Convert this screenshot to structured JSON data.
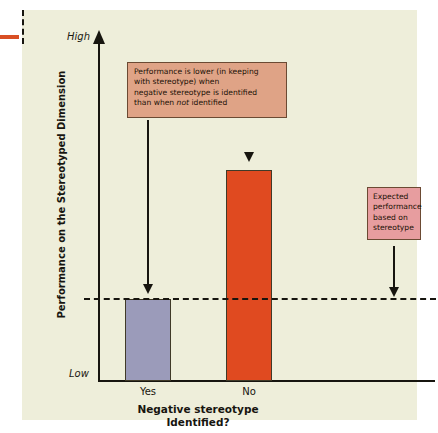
{
  "chart_data": {
    "type": "bar",
    "title": "",
    "categories": [
      "Yes",
      "No"
    ],
    "values": [
      1,
      2.57
    ],
    "series": [
      {
        "name": "Performance on the Stereotyped Dimension",
        "values": [
          1,
          2.57
        ],
        "colors": [
          "#9b9bba",
          "#e04a20"
        ]
      }
    ],
    "xlabel": "Negative stereotype Identified?",
    "ylabel": "Performance on the Stereotyped Dimension",
    "ytick_labels": [
      "Low",
      "High"
    ],
    "ylim": [
      "Low",
      "High"
    ],
    "grid": false,
    "legend": "none",
    "reference_line": {
      "label": "Expected performance based on stereotype",
      "value": 1,
      "style": "dashed"
    },
    "annotations": [
      "Performance is lower (in keeping with stereotype) when negative stereotype is identified than when not identified",
      "Expected performance based on stereotype"
    ]
  },
  "axes": {
    "y_title": "Performance on the Stereotyped Dimension",
    "y_high_label": "High",
    "y_low_label": "Low",
    "x_title_line1": "Negative stereotype",
    "x_title_line2": "Identified?",
    "category_labels": [
      "Yes",
      "No"
    ]
  },
  "callouts": {
    "main": {
      "line1": "Performance is lower (in keeping",
      "line2": "with stereotype) when",
      "line3": "negative stereotype is identified",
      "line4_pre": "than when ",
      "line4_em": "not",
      "line4_post": " identified"
    },
    "expected": {
      "line1": "Expected",
      "line2": "performance",
      "line3": "based on",
      "line4": "stereotype"
    }
  },
  "colors": {
    "panel_background": "#eeeeda",
    "bar_yes": "#9b9bba",
    "bar_no": "#e04a20",
    "callout_main": "#dfa386",
    "callout_expected": "#e79d9f",
    "axis": "#17150f",
    "left_tick": "#d94f24"
  }
}
